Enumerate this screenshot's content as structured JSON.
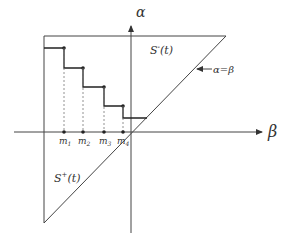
{
  "diagram": {
    "axes": {
      "vertical_label": "α",
      "horizontal_label": "β"
    },
    "regions": {
      "upper_label": "S",
      "upper_sup": "-",
      "upper_arg": "(t)",
      "lower_label": "S",
      "lower_sup": "+",
      "lower_arg": "(t)"
    },
    "diagonal_label": "α=β",
    "tick_labels": [
      {
        "base": "m",
        "sub": "1"
      },
      {
        "base": "m",
        "sub": "2"
      },
      {
        "base": "m",
        "sub": "3"
      },
      {
        "base": "m",
        "sub": "4"
      }
    ],
    "colors": {
      "line": "#333333",
      "dashed": "#777777"
    }
  }
}
